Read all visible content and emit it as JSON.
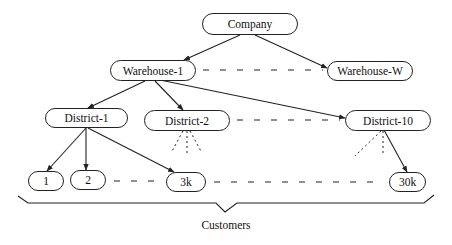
{
  "diagram": {
    "type": "hierarchy",
    "nodes": {
      "company": "Company",
      "warehouse_1": "Warehouse-1",
      "warehouse_w": "Warehouse-W",
      "district_1": "District-1",
      "district_2": "District-2",
      "district_10": "District-10",
      "customer_1": "1",
      "customer_2": "2",
      "customer_3k": "3k",
      "customer_30k": "30k"
    },
    "group_label": "Customers",
    "edges": [
      {
        "from": "Company",
        "to": "Warehouse-1",
        "style": "solid-arrow"
      },
      {
        "from": "Company",
        "to": "Warehouse-W",
        "style": "solid-arrow"
      },
      {
        "from": "Warehouse-1",
        "to": "Warehouse-W",
        "style": "dashed"
      },
      {
        "from": "Warehouse-1",
        "to": "District-1",
        "style": "solid-arrow"
      },
      {
        "from": "Warehouse-1",
        "to": "District-2",
        "style": "solid-arrow"
      },
      {
        "from": "Warehouse-1",
        "to": "District-10",
        "style": "solid-arrow"
      },
      {
        "from": "District-2",
        "to": "District-10",
        "style": "dashed"
      },
      {
        "from": "District-1",
        "to": "1",
        "style": "solid-arrow"
      },
      {
        "from": "District-1",
        "to": "2",
        "style": "solid-arrow"
      },
      {
        "from": "District-1",
        "to": "3k",
        "style": "solid-arrow"
      },
      {
        "from": "District-2",
        "to": "(children)",
        "style": "dotted-fan"
      },
      {
        "from": "District-10",
        "to": "(children)",
        "style": "dotted-fan"
      },
      {
        "from": "District-10",
        "to": "30k",
        "style": "solid-arrow"
      },
      {
        "from": "2",
        "to": "3k",
        "style": "dashed"
      },
      {
        "from": "3k",
        "to": "30k",
        "style": "dashed"
      }
    ]
  },
  "colors": {
    "stroke": "#222222",
    "background": "#ffffff",
    "text": "#111111"
  }
}
